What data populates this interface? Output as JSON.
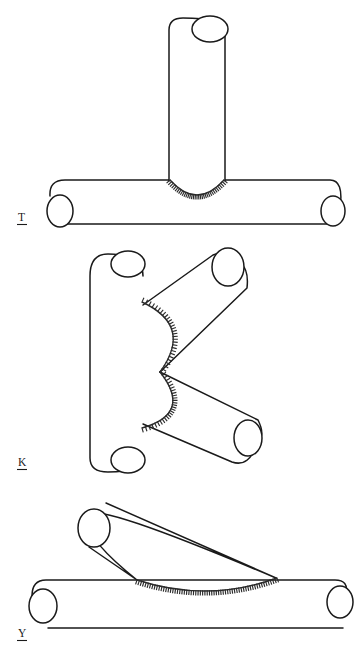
{
  "sheet": {
    "title": "Welded tubular joint configurations",
    "background_color": "#ffffff",
    "line_color": "#1a1a1a",
    "weld_color": "#2b2b2b",
    "width": 356,
    "height": 654
  },
  "figures": [
    {
      "id": "t-joint",
      "label": "T",
      "name": "T-joint",
      "description": "Vertical brace tube welded perpendicular onto a horizontal chord tube",
      "label_position": {
        "x": 18,
        "y": 221
      },
      "members": [
        {
          "name": "vertical-brace",
          "orientation": "vertical",
          "x1": 169,
          "y1": 18,
          "x2": 169,
          "y2": 181,
          "x3": 225,
          "y3": 181,
          "x4": 225,
          "y4": 30,
          "cap_end": "top",
          "cap": {
            "cx": 210,
            "cy": 29,
            "rx": 18,
            "ry": 13
          }
        },
        {
          "name": "horizontal-chord",
          "orientation": "horizontal",
          "x1": 55,
          "y1": 180,
          "x2": 338,
          "y2": 180,
          "x3": 338,
          "y3": 224,
          "x4": 66,
          "y4": 224,
          "cap_left": {
            "cx": 60,
            "cy": 211,
            "rx": 13,
            "ry": 16
          },
          "cap_right": {
            "cx": 333,
            "cy": 211,
            "rx": 12,
            "ry": 15
          }
        }
      ],
      "weld": {
        "type": "hatched-arc",
        "shape": "downward-bulging arc across the brace footprint",
        "start": {
          "x": 170,
          "y": 180
        },
        "end": {
          "x": 224,
          "y": 180
        },
        "sag": 15,
        "hatch_count": 34
      }
    },
    {
      "id": "k-joint",
      "label": "K",
      "name": "K-joint",
      "description": "Two diagonal brace tubes welded to a common footprint on a vertical chord tube",
      "label_position": {
        "x": 18,
        "y": 466
      },
      "members": [
        {
          "name": "vertical-chord",
          "orientation": "vertical",
          "x1": 90,
          "y1": 266,
          "x2": 90,
          "y2": 458,
          "x3": 143,
          "y3": 468,
          "x4": 143,
          "y4": 276,
          "cap_top": {
            "cx": 128,
            "cy": 264,
            "rx": 17,
            "ry": 13
          },
          "cap_bottom": {
            "cx": 128,
            "cy": 460,
            "rx": 17,
            "ry": 13
          }
        },
        {
          "name": "upper-diagonal-brace",
          "orientation": "diagonal-up-right",
          "root": {
            "x": 143,
            "y": 305
          },
          "tip": {
            "x": 247,
            "y": 258
          },
          "cap": {
            "cx": 228,
            "cy": 267,
            "rx": 16,
            "ry": 19
          }
        },
        {
          "name": "lower-diagonal-brace",
          "orientation": "diagonal-down-right",
          "root": {
            "x": 143,
            "y": 424
          },
          "tip": {
            "x": 262,
            "y": 458
          },
          "cap": {
            "cx": 248,
            "cy": 438,
            "rx": 14,
            "ry": 18
          }
        }
      ],
      "weld": {
        "type": "hatched-arc",
        "shape": "two arcs bulging left meeting at a central vertex",
        "vertex": {
          "x": 160,
          "y": 372
        },
        "upper_start": {
          "x": 142,
          "y": 302
        },
        "lower_end": {
          "x": 142,
          "y": 428
        },
        "bulge": 22,
        "hatch_count": 56
      }
    },
    {
      "id": "y-joint",
      "label": "Y",
      "name": "Y-joint",
      "description": "Inclined brace tube welded at an acute angle onto a horizontal chord tube",
      "label_position": {
        "x": 18,
        "y": 637
      },
      "members": [
        {
          "name": "inclined-brace",
          "orientation": "diagonal-down-right",
          "tip": {
            "x": 92,
            "y": 503
          },
          "root": {
            "x": 278,
            "y": 578
          },
          "cap": {
            "cx": 94,
            "cy": 528,
            "rx": 16,
            "ry": 19
          }
        },
        {
          "name": "horizontal-chord",
          "orientation": "horizontal",
          "x1": 38,
          "y1": 580,
          "x2": 345,
          "y2": 580,
          "x3": 345,
          "y3": 628,
          "x4": 48,
          "y4": 628,
          "cap_left": {
            "cx": 43,
            "cy": 606,
            "rx": 14,
            "ry": 17
          },
          "cap_right": {
            "cx": 340,
            "cy": 602,
            "rx": 13,
            "ry": 16
          }
        }
      ],
      "weld": {
        "type": "hatched-arc",
        "shape": "long shallow arc along the chord under the brace toe",
        "start": {
          "x": 137,
          "y": 580
        },
        "end": {
          "x": 277,
          "y": 578
        },
        "sag": 12,
        "hatch_count": 62
      }
    }
  ]
}
